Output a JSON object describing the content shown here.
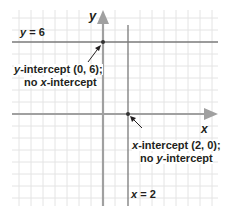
{
  "diagram": {
    "type": "coordinate-plane",
    "axes": {
      "x_label": "x",
      "y_label": "y"
    },
    "lines": [
      {
        "equation": "y = 6",
        "orientation": "horizontal",
        "value": 6
      },
      {
        "equation": "x = 2",
        "orientation": "vertical",
        "value": 2
      }
    ],
    "annotations": [
      {
        "line1": "y-intercept (0, 6);",
        "line2": "no x-intercept",
        "point": [
          0,
          6
        ]
      },
      {
        "line1": "x-intercept (2, 0);",
        "line2": "no y-intercept",
        "point": [
          2,
          0
        ]
      }
    ],
    "colors": {
      "axis": "#9e9e9e",
      "grid": "#e6e6e6",
      "line": "#7a7a7a",
      "text": "#231f20"
    }
  },
  "labels": {
    "y_axis": "y",
    "x_axis": "x",
    "hline_var": "y",
    "hline_rest": " = 6",
    "vline_var": "x",
    "vline_rest": " = 2",
    "yint_var": "y",
    "yint_rest": "-intercept (0, 6);",
    "yint_no_pre": "no ",
    "yint_no_var": "x",
    "yint_no_rest": "-intercept",
    "xint_var": "x",
    "xint_rest": "-intercept (2, 0);",
    "xint_no_pre": "no ",
    "xint_no_var": "y",
    "xint_no_rest": "-intercept"
  }
}
